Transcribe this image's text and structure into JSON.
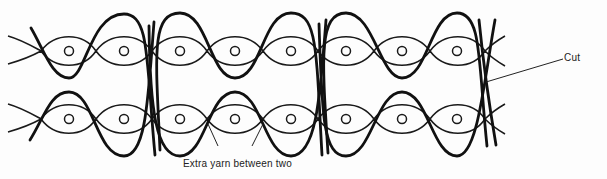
{
  "figure": {
    "rows": [
      {
        "name": "top-row",
        "center_y": 51,
        "loop_x": [
          69,
          124,
          180,
          235,
          291,
          346,
          402,
          457
        ]
      },
      {
        "name": "bottom-row",
        "center_y": 119,
        "loop_x": [
          69,
          124,
          180,
          235,
          291,
          346,
          402,
          457
        ]
      }
    ],
    "labels": {
      "cut": "Cut",
      "extra_yarn": "Extra yarn between two"
    },
    "colors": {
      "ink": "#111111",
      "background": "#fdfdfd"
    }
  }
}
